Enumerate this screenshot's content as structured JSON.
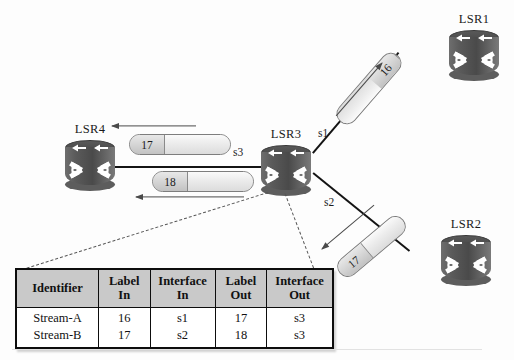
{
  "diagram": {
    "routers": [
      {
        "id": "lsr1",
        "label": "LSR1"
      },
      {
        "id": "lsr2",
        "label": "LSR2"
      },
      {
        "id": "lsr3",
        "label": "LSR3"
      },
      {
        "id": "lsr4",
        "label": "LSR4"
      }
    ],
    "interfaces": [
      {
        "id": "s3",
        "label": "s3"
      },
      {
        "id": "s1",
        "label": "s1"
      },
      {
        "id": "s2",
        "label": "s2"
      }
    ],
    "packets": [
      {
        "id": "pkt-16",
        "label": "16",
        "direction": "toward-lsr3"
      },
      {
        "id": "pkt-17-in",
        "label": "17",
        "direction": "toward-lsr3"
      },
      {
        "id": "pkt-17-out",
        "label": "17",
        "direction": "toward-lsr4"
      },
      {
        "id": "pkt-18-out",
        "label": "18",
        "direction": "toward-lsr4"
      }
    ]
  },
  "table": {
    "headers": [
      "Identifier",
      "Label\nIn",
      "Interface\nIn",
      "Label\nOut",
      "Interface\nOut"
    ],
    "headers_split": [
      {
        "line1": "Identifier",
        "line2": ""
      },
      {
        "line1": "Label",
        "line2": "In"
      },
      {
        "line1": "Interface",
        "line2": "In"
      },
      {
        "line1": "Label",
        "line2": "Out"
      },
      {
        "line1": "Interface",
        "line2": "Out"
      }
    ],
    "rows": [
      {
        "identifier": "Stream-A",
        "label_in": "16",
        "interface_in": "s1",
        "label_out": "17",
        "interface_out": "s3"
      },
      {
        "identifier": "Stream-B",
        "label_in": "17",
        "interface_in": "s2",
        "label_out": "18",
        "interface_out": "s3"
      }
    ]
  },
  "colors": {
    "router_body": "#4a4a4a",
    "link": "#141414",
    "packet_fill": "#e3e3e3",
    "table_header_fill": "#c9c9c9",
    "table_border": "#0d0d0d"
  }
}
